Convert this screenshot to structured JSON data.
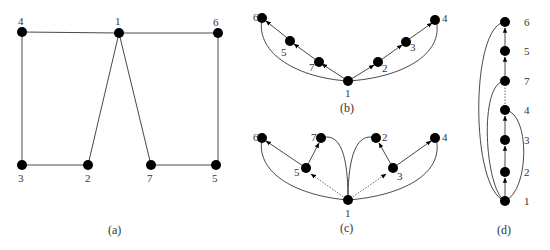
{
  "panels": {
    "a": {
      "caption": "(a)",
      "labels": {
        "1": "1",
        "2": "2",
        "3": "3",
        "4": "4",
        "5": "5",
        "6": "6",
        "7": "7"
      }
    },
    "b": {
      "caption": "(b)",
      "labels": {
        "1": "1",
        "2": "2",
        "3": "3",
        "4": "4",
        "5": "5",
        "6": "6",
        "7": "7"
      }
    },
    "c": {
      "caption": "(c)",
      "labels": {
        "1": "1",
        "2": "2",
        "3": "3",
        "4": "4",
        "5": "5",
        "6": "6",
        "7": "7"
      }
    },
    "d": {
      "caption": "(d)",
      "labels": {
        "1": "1",
        "2": "2",
        "3": "3",
        "4": "4",
        "5": "5",
        "6": "6",
        "7": "7"
      }
    }
  }
}
